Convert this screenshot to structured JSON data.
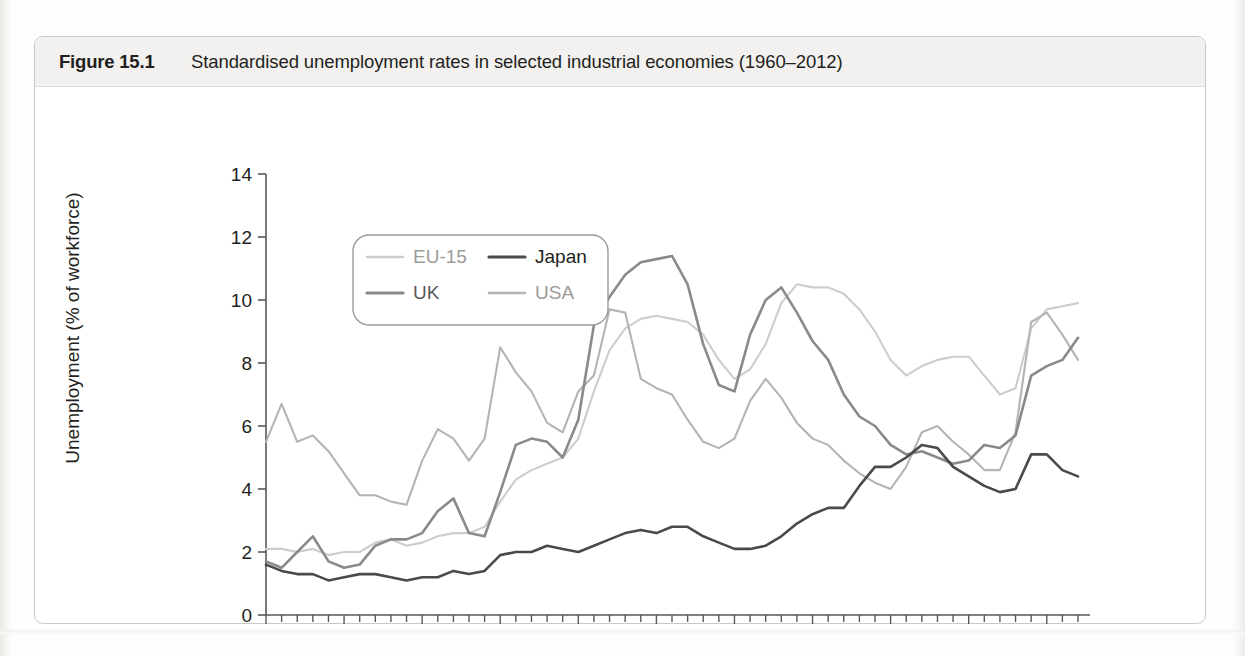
{
  "figure": {
    "number_label": "Figure 15.1",
    "title": "Standardised unemployment rates in selected industrial economies (1960–2012)"
  },
  "footnote": "",
  "legend": {
    "entries": [
      {
        "label": "EU-15",
        "color": "#cdcdcb"
      },
      {
        "label": "Japan",
        "color": "#4a4a4c"
      },
      {
        "label": "UK",
        "color": "#8a8a8c"
      },
      {
        "label": "USA",
        "color": "#b4b4b2"
      }
    ]
  },
  "chart_data": {
    "type": "line",
    "title": "Standardised unemployment rates in selected industrial economies (1960–2012)",
    "xlabel": "",
    "ylabel": "Unemployment (% of workforce)",
    "xlim": [
      1960,
      2012
    ],
    "ylim": [
      0,
      14
    ],
    "ytick_step": 2,
    "yticks": [
      0,
      2,
      4,
      6,
      8,
      10,
      12,
      14
    ],
    "xticks_major": [
      1960,
      1965,
      1970,
      1975,
      1980,
      1985,
      1990,
      1995,
      2000,
      2005,
      2010
    ],
    "xtick_minor_step": 1,
    "grid": false,
    "legend_position": "upper-left-inside",
    "x": [
      1960,
      1961,
      1962,
      1963,
      1964,
      1965,
      1966,
      1967,
      1968,
      1969,
      1970,
      1971,
      1972,
      1973,
      1974,
      1975,
      1976,
      1977,
      1978,
      1979,
      1980,
      1981,
      1982,
      1983,
      1984,
      1985,
      1986,
      1987,
      1988,
      1989,
      1990,
      1991,
      1992,
      1993,
      1994,
      1995,
      1996,
      1997,
      1998,
      1999,
      2000,
      2001,
      2002,
      2003,
      2004,
      2005,
      2006,
      2007,
      2008,
      2009,
      2010,
      2011,
      2012
    ],
    "series": [
      {
        "name": "EU-15",
        "color": "#cdcdcb",
        "values": [
          2.1,
          2.1,
          2.0,
          2.1,
          1.9,
          2.0,
          2.0,
          2.3,
          2.4,
          2.2,
          2.3,
          2.5,
          2.6,
          2.6,
          2.8,
          3.6,
          4.3,
          4.6,
          4.8,
          5.0,
          5.6,
          7.1,
          8.4,
          9.1,
          9.4,
          9.5,
          9.4,
          9.3,
          8.9,
          8.1,
          7.5,
          7.8,
          8.6,
          9.9,
          10.5,
          10.4,
          10.4,
          10.2,
          9.7,
          9.0,
          8.1,
          7.6,
          7.9,
          8.1,
          8.2,
          8.2,
          7.6,
          7.0,
          7.2,
          9.1,
          9.7,
          9.8,
          9.9
        ]
      },
      {
        "name": "USA",
        "color": "#b4b4b2",
        "values": [
          5.5,
          6.7,
          5.5,
          5.7,
          5.2,
          4.5,
          3.8,
          3.8,
          3.6,
          3.5,
          4.9,
          5.9,
          5.6,
          4.9,
          5.6,
          8.5,
          7.7,
          7.1,
          6.1,
          5.8,
          7.1,
          7.6,
          9.7,
          9.6,
          7.5,
          7.2,
          7.0,
          6.2,
          5.5,
          5.3,
          5.6,
          6.8,
          7.5,
          6.9,
          6.1,
          5.6,
          5.4,
          4.9,
          4.5,
          4.2,
          4.0,
          4.7,
          5.8,
          6.0,
          5.5,
          5.1,
          4.6,
          4.6,
          5.8,
          9.3,
          9.6,
          8.9,
          8.1
        ]
      },
      {
        "name": "UK",
        "color": "#8a8a8c",
        "values": [
          1.7,
          1.5,
          2.0,
          2.5,
          1.7,
          1.5,
          1.6,
          2.2,
          2.4,
          2.4,
          2.6,
          3.3,
          3.7,
          2.6,
          2.5,
          3.9,
          5.4,
          5.6,
          5.5,
          5.0,
          6.2,
          9.2,
          10.1,
          10.8,
          11.2,
          11.3,
          11.4,
          10.5,
          8.6,
          7.3,
          7.1,
          8.9,
          10.0,
          10.4,
          9.6,
          8.7,
          8.1,
          7.0,
          6.3,
          6.0,
          5.4,
          5.1,
          5.2,
          5.0,
          4.8,
          4.9,
          5.4,
          5.3,
          5.7,
          7.6,
          7.9,
          8.1,
          8.8
        ]
      },
      {
        "name": "Japan",
        "color": "#4a4a4c",
        "values": [
          1.6,
          1.4,
          1.3,
          1.3,
          1.1,
          1.2,
          1.3,
          1.3,
          1.2,
          1.1,
          1.2,
          1.2,
          1.4,
          1.3,
          1.4,
          1.9,
          2.0,
          2.0,
          2.2,
          2.1,
          2.0,
          2.2,
          2.4,
          2.6,
          2.7,
          2.6,
          2.8,
          2.8,
          2.5,
          2.3,
          2.1,
          2.1,
          2.2,
          2.5,
          2.9,
          3.2,
          3.4,
          3.4,
          4.1,
          4.7,
          4.7,
          5.0,
          5.4,
          5.3,
          4.7,
          4.4,
          4.1,
          3.9,
          4.0,
          5.1,
          5.1,
          4.6,
          4.4
        ]
      }
    ]
  }
}
